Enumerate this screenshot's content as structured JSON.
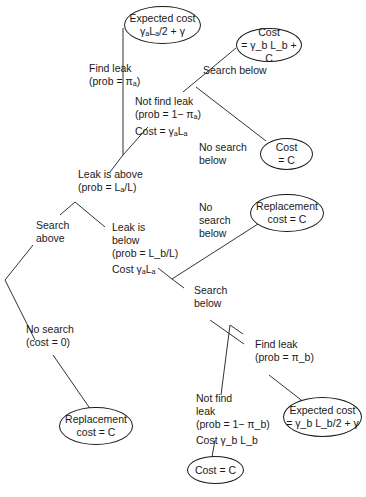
{
  "nodes": {
    "top_expected": {
      "line1": "Expected cost",
      "line2": "γₐLₐ/2 + γ"
    },
    "cost_search_below": {
      "line1": "Cost",
      "line2": "= γ_b L_b + C"
    },
    "cost_no_search_below": {
      "line1": "Cost",
      "line2": "= C"
    },
    "replacement_right": {
      "line1": "Replacement",
      "line2": "cost = C"
    },
    "replacement_left": {
      "line1": "Replacement",
      "line2": "cost = C"
    },
    "expected_bottom": {
      "line1": "Expected cost",
      "line2": "= γ_b L_b/2 + γ"
    },
    "cost_bottom": {
      "line1": "Cost = C"
    }
  },
  "labels": {
    "find_leak_a": [
      "Find leak",
      "(prob = πₐ)"
    ],
    "not_find_leak_a": [
      "Not find leak",
      "(prob = 1− πₐ)",
      "Cost = γₐLₐ"
    ],
    "search_below_top": [
      "Search below"
    ],
    "no_search_below_top": [
      "No search",
      "below"
    ],
    "leak_above": [
      "Leak is above",
      "(prob = Lₐ/L)"
    ],
    "search_above": [
      "Search",
      "above"
    ],
    "leak_below": [
      "Leak is",
      "below",
      "(prob = L_b/L)",
      "Cost γₐLₐ"
    ],
    "no_search_below_mid": [
      "No",
      "search",
      "below"
    ],
    "search_below_mid": [
      "Search",
      "below"
    ],
    "no_search": [
      "No search",
      "(cost = 0)"
    ],
    "find_leak_b": [
      "Find leak",
      "(prob = π_b)"
    ],
    "not_find_leak_b": [
      "Not find",
      "leak",
      "(prob = 1− π_b)",
      "Cost γ_b L_b"
    ]
  }
}
